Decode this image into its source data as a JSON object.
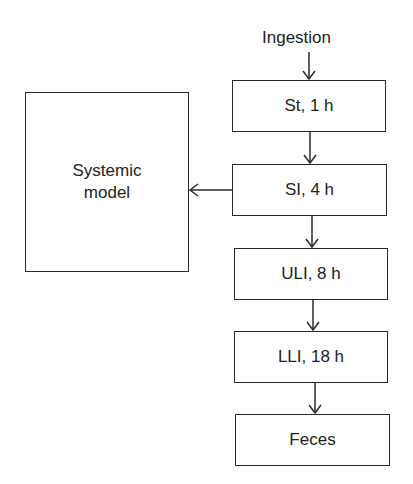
{
  "diagram": {
    "input_label": "Ingestion",
    "compartments": [
      {
        "id": "st",
        "label": "St, 1 h"
      },
      {
        "id": "si",
        "label": "SI, 4 h"
      },
      {
        "id": "uli",
        "label": "ULI, 8 h"
      },
      {
        "id": "lli",
        "label": "LLI, 18 h"
      },
      {
        "id": "feces",
        "label": "Feces"
      }
    ],
    "systemic": {
      "line1": "Systemic",
      "line2": "model"
    },
    "edges": [
      {
        "from": "Ingestion",
        "to": "St, 1 h"
      },
      {
        "from": "St, 1 h",
        "to": "SI, 4 h"
      },
      {
        "from": "SI, 4 h",
        "to": "Systemic model"
      },
      {
        "from": "SI, 4 h",
        "to": "ULI, 8 h"
      },
      {
        "from": "ULI, 8 h",
        "to": "LLI, 18 h"
      },
      {
        "from": "LLI, 18 h",
        "to": "Feces"
      }
    ]
  }
}
